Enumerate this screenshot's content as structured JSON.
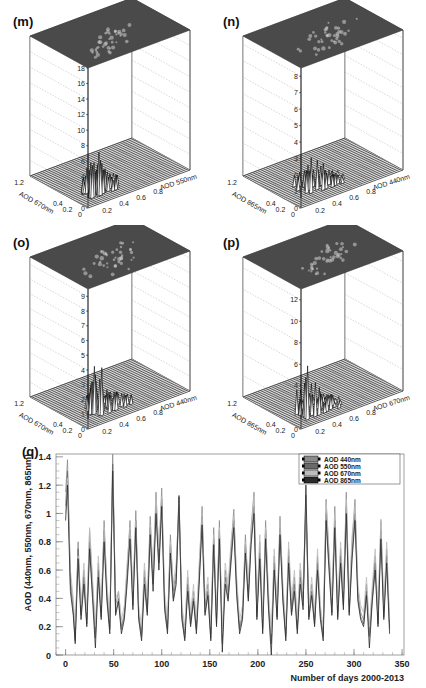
{
  "chart_data": [
    {
      "panel": "(m)",
      "type": "lego3d",
      "title": "2D Component",
      "xlabel": "AOD 550nm",
      "ylabel": "AOD 670nm",
      "xticks": [
        "0",
        "0.2",
        "0.4",
        "0.6",
        "0.8",
        "1",
        "1.2"
      ],
      "yticks": [
        "0",
        "0.2",
        "0.4",
        "0.6",
        "0.8",
        "1",
        "1.2"
      ],
      "zticks": [
        "0",
        "2",
        "4",
        "6",
        "8",
        "10",
        "12",
        "14",
        "16",
        "18"
      ],
      "zlim": [
        0,
        18
      ],
      "peak_z": 9,
      "peak_location": [
        0.15,
        0.15
      ],
      "spread": 0.35
    },
    {
      "panel": "(n)",
      "type": "lego3d",
      "title": "2D Component",
      "xlabel": "AOD 440nm",
      "ylabel": "AOD 865nm",
      "xticks": [
        "0",
        "0.2",
        "0.4",
        "0.6",
        "0.8",
        "1",
        "1.2"
      ],
      "yticks": [
        "0",
        "0.2",
        "0.4",
        "0.6",
        "0.8",
        "1",
        "1.2"
      ],
      "zticks": [
        "0",
        "1",
        "2",
        "3",
        "4",
        "5",
        "6",
        "7",
        "8"
      ],
      "zlim": [
        0,
        8.5
      ],
      "peak_z": 4.6,
      "peak_location": [
        0.2,
        0.2
      ],
      "spread": 0.5
    },
    {
      "panel": "(o)",
      "type": "lego3d",
      "title": "2D Component",
      "xlabel": "AOD 440nm",
      "ylabel": "AOD 670nm",
      "xticks": [
        "0",
        "0.2",
        "0.4",
        "0.6",
        "0.8",
        "1",
        "1.2"
      ],
      "yticks": [
        "0",
        "0.2",
        "0.4",
        "0.6",
        "0.8",
        "1",
        "1.2"
      ],
      "zticks": [
        "0",
        "1",
        "2",
        "3",
        "4",
        "5",
        "6",
        "7",
        "8",
        "9"
      ],
      "zlim": [
        0,
        9.5
      ],
      "peak_z": 6,
      "peak_location": [
        0.18,
        0.18
      ],
      "spread": 0.45
    },
    {
      "panel": "(p)",
      "type": "lego3d",
      "title": "AOD Component",
      "xlabel": "AOD 670nm",
      "ylabel": "AOD 865nm",
      "xticks": [
        "0",
        "0.2",
        "0.4",
        "0.6",
        "0.8",
        "1",
        "1.2"
      ],
      "yticks": [
        "0",
        "0.2",
        "0.4",
        "0.6",
        "0.8",
        "1",
        "1.2"
      ],
      "zticks": [
        "0",
        "2",
        "4",
        "6",
        "8",
        "10",
        "12"
      ],
      "zlim": [
        0,
        13
      ],
      "peak_z": 7,
      "peak_location": [
        0.15,
        0.15
      ],
      "spread": 0.45
    },
    {
      "panel": "(q)",
      "type": "line",
      "title": "",
      "xlabel": "Number of days 2000-2013",
      "ylabel": "AOD (440nm, 550nm, 670nm, 865nm)",
      "xlim": [
        -10,
        352
      ],
      "ylim": [
        0,
        1.42
      ],
      "xticks": [
        0,
        50,
        100,
        150,
        200,
        250,
        300,
        350
      ],
      "yticks": [
        0,
        0.2,
        0.4,
        0.6,
        0.8,
        1,
        1.2,
        1.4
      ],
      "ytick_labels": [
        "0",
        "0.2",
        "0.4",
        "0.6",
        "0.8",
        "1",
        "1.2",
        "1.4"
      ],
      "legend_position": "top-right",
      "x": [
        0,
        2,
        5,
        8,
        10,
        13,
        16,
        19,
        22,
        25,
        28,
        31,
        34,
        37,
        40,
        43,
        46,
        49,
        52,
        55,
        58,
        61,
        64,
        67,
        70,
        73,
        76,
        79,
        82,
        85,
        88,
        91,
        94,
        97,
        100,
        103,
        106,
        109,
        112,
        115,
        118,
        121,
        124,
        127,
        130,
        133,
        136,
        139,
        142,
        145,
        148,
        151,
        154,
        157,
        160,
        163,
        166,
        169,
        172,
        175,
        178,
        181,
        184,
        187,
        190,
        193,
        196,
        199,
        202,
        205,
        208,
        211,
        214,
        217,
        220,
        223,
        226,
        229,
        232,
        235,
        238,
        241,
        244,
        247,
        250,
        253,
        256,
        259,
        262,
        265,
        268,
        271,
        274,
        277,
        280,
        283,
        286,
        289,
        292,
        295,
        298,
        301,
        304,
        307,
        310,
        313,
        316,
        319,
        322,
        325,
        328,
        331,
        334,
        337
      ],
      "series": [
        {
          "name": "AOD 440nm",
          "color": "#8a8a8a",
          "values": [
            1.15,
            1.38,
            0.55,
            0.35,
            0.12,
            0.8,
            0.3,
            0.6,
            0.25,
            0.88,
            0.5,
            0.15,
            0.65,
            0.3,
            0.95,
            0.45,
            0.2,
            1.42,
            0.35,
            0.45,
            0.2,
            0.3,
            0.6,
            0.95,
            0.4,
            1.02,
            0.3,
            0.15,
            0.6,
            0.35,
            0.98,
            0.55,
            1.15,
            0.7,
            1.18,
            0.4,
            0.2,
            0.85,
            0.45,
            0.6,
            1.13,
            0.3,
            0.15,
            0.55,
            0.25,
            0.45,
            0.2,
            0.6,
            1.05,
            0.35,
            0.5,
            0.15,
            0.9,
            0.25,
            0.95,
            0.1,
            0.6,
            0.45,
            0.75,
            1.03,
            0.5,
            0.2,
            0.3,
            0.85,
            0.45,
            0.9,
            1.15,
            0.3,
            0.8,
            0.2,
            0.95,
            0.4,
            0.1,
            0.7,
            0.3,
            0.98,
            0.45,
            0.15,
            0.75,
            0.35,
            0.55,
            0.2,
            0.6,
            0.4,
            1.13,
            0.3,
            0.5,
            0.25,
            0.7,
            0.3,
            0.15,
            1.1,
            0.7,
            0.35,
            1.05,
            0.3,
            0.75,
            0.4,
            1.15,
            0.35,
            0.8,
            1.1,
            0.45,
            0.3,
            0.25,
            0.5,
            0.15,
            0.45,
            0.7,
            0.25,
            0.95,
            0.3,
            0.75,
            0.2
          ]
        },
        {
          "name": "AOD 550nm",
          "color": "#6a6a6a",
          "values": [
            1.05,
            1.3,
            0.5,
            0.3,
            0.1,
            0.75,
            0.28,
            0.55,
            0.22,
            0.8,
            0.45,
            0.12,
            0.6,
            0.27,
            0.88,
            0.4,
            0.18,
            1.35,
            0.3,
            0.4,
            0.18,
            0.27,
            0.55,
            0.88,
            0.35,
            0.95,
            0.27,
            0.13,
            0.55,
            0.3,
            0.9,
            0.5,
            1.05,
            0.65,
            1.1,
            0.35,
            0.18,
            0.78,
            0.4,
            0.55,
            1.05,
            0.27,
            0.12,
            0.5,
            0.22,
            0.4,
            0.18,
            0.55,
            0.98,
            0.3,
            0.45,
            0.12,
            0.82,
            0.22,
            0.88,
            0.08,
            0.55,
            0.4,
            0.7,
            0.95,
            0.45,
            0.18,
            0.27,
            0.78,
            0.4,
            0.82,
            1.05,
            0.27,
            0.72,
            0.18,
            0.88,
            0.35,
            0.08,
            0.65,
            0.27,
            0.9,
            0.4,
            0.13,
            0.7,
            0.3,
            0.5,
            0.18,
            0.55,
            0.35,
            1.05,
            0.27,
            0.45,
            0.22,
            0.65,
            0.27,
            0.13,
            1.0,
            0.65,
            0.3,
            0.95,
            0.27,
            0.7,
            0.35,
            1.05,
            0.3,
            0.72,
            1.0,
            0.4,
            0.27,
            0.22,
            0.45,
            0.13,
            0.4,
            0.65,
            0.22,
            0.88,
            0.27,
            0.7,
            0.18
          ]
        },
        {
          "name": "AOD 670nm",
          "color": "#bdbdbd",
          "values": [
            1.0,
            1.25,
            0.6,
            0.4,
            0.2,
            0.7,
            0.35,
            0.65,
            0.3,
            0.9,
            0.55,
            0.2,
            0.7,
            0.35,
            0.9,
            0.5,
            0.25,
            1.3,
            0.4,
            0.45,
            0.25,
            0.35,
            0.65,
            0.9,
            0.45,
            0.95,
            0.35,
            0.2,
            0.65,
            0.4,
            0.92,
            0.6,
            1.1,
            0.75,
            1.12,
            0.45,
            0.25,
            0.8,
            0.5,
            0.65,
            1.08,
            0.35,
            0.2,
            0.6,
            0.3,
            0.5,
            0.25,
            0.65,
            1.0,
            0.4,
            0.55,
            0.2,
            0.85,
            0.3,
            0.9,
            0.15,
            0.65,
            0.5,
            0.8,
            0.98,
            0.55,
            0.25,
            0.35,
            0.8,
            0.5,
            0.88,
            1.12,
            0.35,
            0.85,
            0.25,
            0.9,
            0.45,
            0.15,
            0.75,
            0.35,
            0.92,
            0.5,
            0.2,
            0.8,
            0.4,
            0.6,
            0.25,
            0.65,
            0.45,
            1.1,
            0.35,
            0.55,
            0.3,
            0.75,
            0.35,
            0.2,
            1.08,
            0.75,
            0.4,
            1.0,
            0.35,
            0.8,
            0.45,
            1.1,
            0.4,
            0.85,
            1.05,
            0.5,
            0.35,
            0.3,
            0.55,
            0.2,
            0.5,
            0.75,
            0.3,
            0.96,
            0.35,
            0.8,
            0.25
          ]
        },
        {
          "name": "AOD 865nm",
          "color": "#2a2a2a",
          "values": [
            0.95,
            1.2,
            0.45,
            0.28,
            0.08,
            0.68,
            0.25,
            0.5,
            0.2,
            0.75,
            0.4,
            0.05,
            0.55,
            0.25,
            0.8,
            0.38,
            0.15,
            1.3,
            0.28,
            0.38,
            0.15,
            0.25,
            0.5,
            0.82,
            0.32,
            0.9,
            0.25,
            0.1,
            0.5,
            0.28,
            0.85,
            0.45,
            1.0,
            0.6,
            1.05,
            0.32,
            0.15,
            0.72,
            0.38,
            0.5,
            1.12,
            0.25,
            0.1,
            0.45,
            0.2,
            0.38,
            0.15,
            0.5,
            0.92,
            0.28,
            0.42,
            0.1,
            0.78,
            0.2,
            0.82,
            0.02,
            0.5,
            0.38,
            0.65,
            0.9,
            0.42,
            0.15,
            0.25,
            0.72,
            0.38,
            0.78,
            1.0,
            0.25,
            0.68,
            0.15,
            0.82,
            0.32,
            0.0,
            0.6,
            0.25,
            0.85,
            0.38,
            0.1,
            0.65,
            0.28,
            0.45,
            0.15,
            0.5,
            0.32,
            1.2,
            0.25,
            0.42,
            0.2,
            0.6,
            0.25,
            0.1,
            0.95,
            0.6,
            0.28,
            0.9,
            0.25,
            0.65,
            0.32,
            1.0,
            0.28,
            0.68,
            0.95,
            0.38,
            0.25,
            0.2,
            0.42,
            0.05,
            0.38,
            0.6,
            0.2,
            0.82,
            0.25,
            0.65,
            0.15
          ]
        }
      ]
    }
  ]
}
